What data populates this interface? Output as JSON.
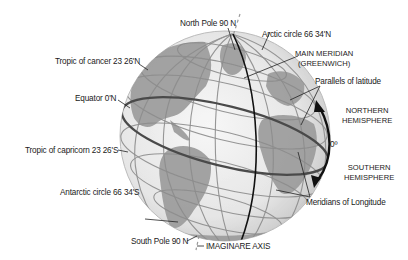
{
  "diagram": {
    "type": "globe-latitude-longitude",
    "labels": {
      "north_pole": "North Pole 90 N",
      "arctic_circle": "Arctic circle 66 34'N",
      "main_meridian_line1": "MAIN MERIDIAN",
      "main_meridian_line2": "(GREENWICH)",
      "tropic_cancer": "Tropic of cancer 23 26'N",
      "parallels": "Parallels of latitude",
      "equator": "Equator 0'N",
      "northern_line1": "NORTHERN",
      "northern_line2": "HEMISPHERE",
      "zero_degree": "0º",
      "tropic_capricorn": "Tropic of capricorn 23 26'S",
      "southern_line1": "SOUTHERN",
      "southern_line2": "HEMISPHERE",
      "antarctic_circle": "Antarctic circle 66 34'S",
      "meridians": "Meridians of Longitude",
      "south_pole": "South Pole 90 N",
      "axis": "IMAGINARE AXIS"
    },
    "colors": {
      "ocean": "#ececec",
      "land": "#9a9a9a",
      "grid": "#8c8c8c",
      "equator": "#444444",
      "meridian": "#111111",
      "text": "#1a1a1a"
    }
  }
}
